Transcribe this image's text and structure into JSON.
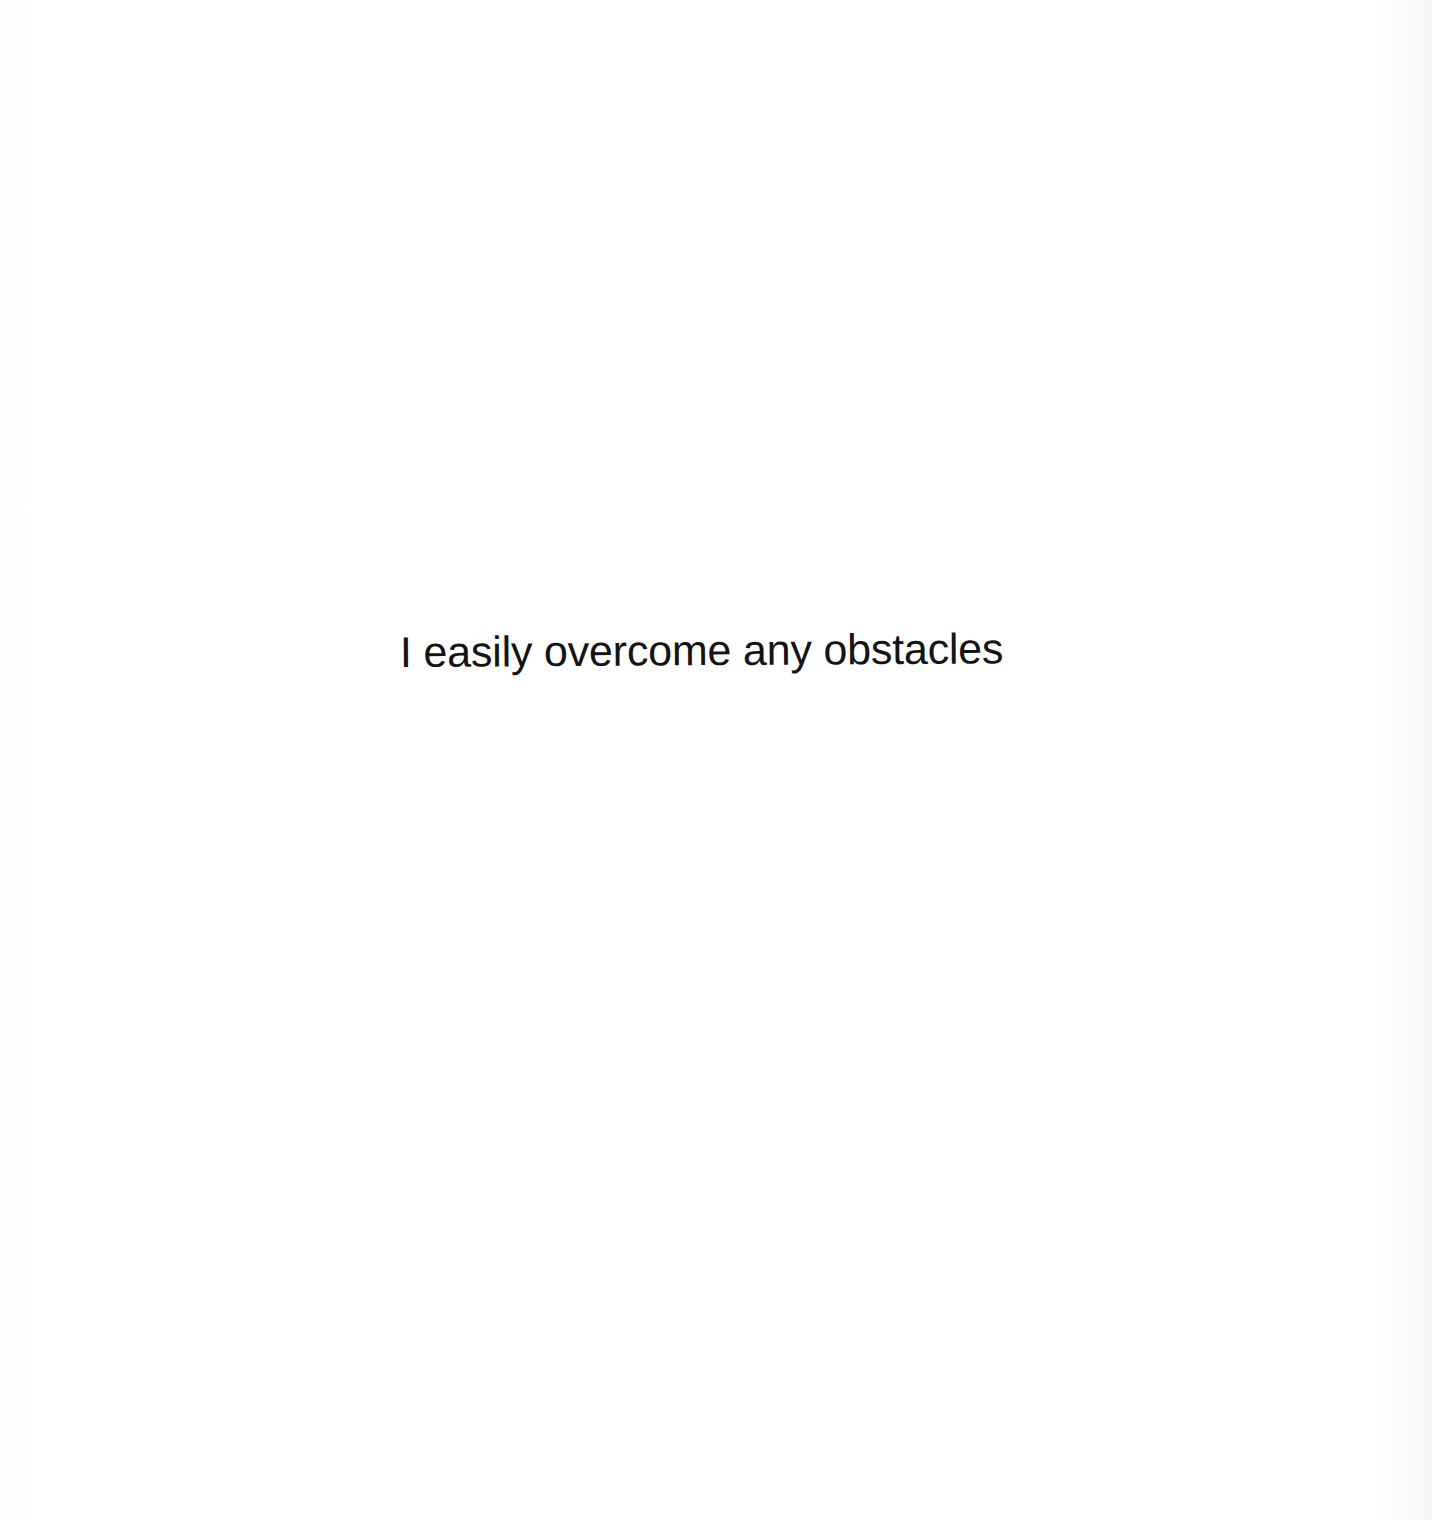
{
  "page": {
    "background": "#fefefe",
    "text_color": "#141414"
  },
  "content": {
    "statement": "I easily overcome any obstacles"
  }
}
